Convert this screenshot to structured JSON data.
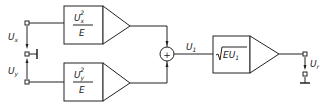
{
  "diagram": {
    "title": "",
    "inputs": {
      "ux": {
        "main": "U",
        "sub": "x"
      },
      "uy": {
        "main": "U",
        "sub": "y"
      }
    },
    "blocks": {
      "square_x": {
        "num_main": "U",
        "num_sub": "x",
        "num_sup": "2",
        "den": "E"
      },
      "square_y": {
        "num_main": "U",
        "num_sub": "y",
        "num_sup": "2",
        "den": "E"
      },
      "sqrt": {
        "text": "EU",
        "sub": "1"
      }
    },
    "summer": {
      "symbol": "+"
    },
    "signals": {
      "u1": {
        "main": "U",
        "sub": "1"
      },
      "ur": {
        "main": "U",
        "sub": "r"
      }
    }
  }
}
